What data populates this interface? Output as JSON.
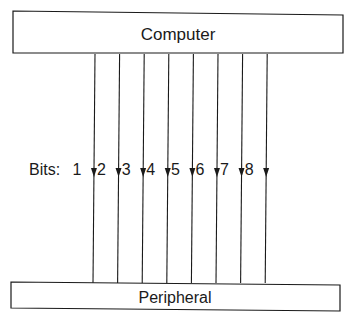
{
  "diagram": {
    "top_box": {
      "label": "Computer"
    },
    "bottom_box": {
      "label": "Peripheral"
    },
    "bits_label": "Bits:",
    "bits": [
      {
        "number": "1",
        "direction": "down"
      },
      {
        "number": "2",
        "direction": "down"
      },
      {
        "number": "3",
        "direction": "down"
      },
      {
        "number": "4",
        "direction": "down"
      },
      {
        "number": "5",
        "direction": "down"
      },
      {
        "number": "6",
        "direction": "down"
      },
      {
        "number": "7",
        "direction": "down"
      },
      {
        "number": "8",
        "direction": "down"
      }
    ],
    "colors": {
      "stroke": "#1a1a1a",
      "background": "#ffffff"
    }
  }
}
